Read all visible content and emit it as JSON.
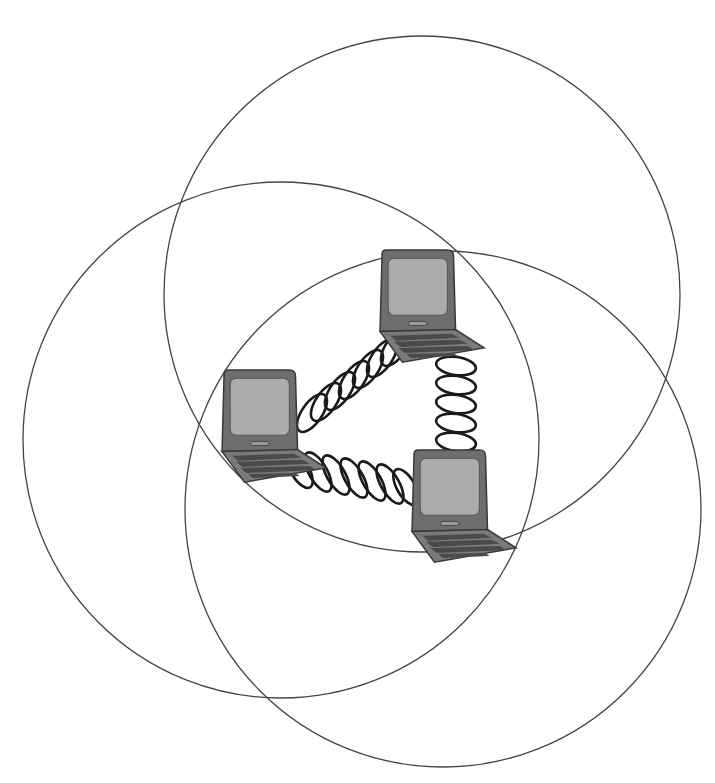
{
  "diagram": {
    "colors": {
      "background": "#ffffff",
      "circle_stroke": "#444444",
      "coil_stroke": "#1a1a1a",
      "laptop_lid": "#6e6e6e",
      "laptop_screen": "#ababab",
      "laptop_base": "#7a7a7a"
    },
    "coverage_circles": [
      {
        "id": "top",
        "cx": 422,
        "cy": 294,
        "r": 258
      },
      {
        "id": "left",
        "cx": 281,
        "cy": 440,
        "r": 258
      },
      {
        "id": "bottom-right",
        "cx": 443,
        "cy": 509,
        "r": 258
      }
    ],
    "nodes": [
      {
        "id": "laptop-top",
        "x": 378,
        "y": 250
      },
      {
        "id": "laptop-left",
        "x": 220,
        "y": 370
      },
      {
        "id": "laptop-bottom-right",
        "x": 410,
        "y": 450
      }
    ],
    "links": [
      {
        "from": "laptop-left",
        "to": "laptop-top",
        "type": "coil"
      },
      {
        "from": "laptop-top",
        "to": "laptop-bottom-right",
        "type": "coil"
      },
      {
        "from": "laptop-left",
        "to": "laptop-bottom-right",
        "type": "coil"
      }
    ]
  }
}
